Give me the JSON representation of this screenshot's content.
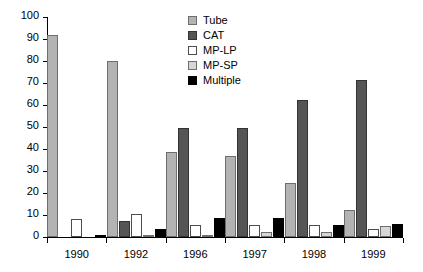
{
  "chart_data": {
    "type": "bar",
    "title": "",
    "subtitle": "",
    "xlabel": "",
    "ylabel": "",
    "ylim": [
      0,
      100
    ],
    "ytick_step": 10,
    "yticks": [
      "100",
      "90",
      "80",
      "70",
      "60",
      "50",
      "40",
      "30",
      "20",
      "10",
      "0"
    ],
    "grid": false,
    "legend_position": "top-right",
    "categories": [
      "1990",
      "1992",
      "1996",
      "1997",
      "1998",
      "1999"
    ],
    "series": [
      {
        "name": "Tube",
        "color": "#b3b3b3",
        "values": [
          92,
          80,
          38.5,
          37,
          24.5,
          12.5
        ]
      },
      {
        "name": "CAT",
        "color": "#555555",
        "values": [
          0,
          7.5,
          49.5,
          49.5,
          62.5,
          71.5
        ]
      },
      {
        "name": "MP-LP",
        "color": "#ffffff",
        "values": [
          8,
          10.5,
          5.5,
          5.5,
          5.5,
          3.5
        ]
      },
      {
        "name": "MP-SP",
        "color": "#d6d6d6",
        "values": [
          0,
          1,
          1,
          2.5,
          2.5,
          5
        ]
      },
      {
        "name": "Multiple",
        "color": "#000000",
        "values": [
          1,
          3.5,
          8.5,
          8.5,
          5.5,
          6
        ]
      }
    ]
  },
  "legend": {
    "items": [
      {
        "label": "Tube"
      },
      {
        "label": "CAT"
      },
      {
        "label": "MP-LP"
      },
      {
        "label": "MP-SP"
      },
      {
        "label": "Multiple"
      }
    ]
  }
}
